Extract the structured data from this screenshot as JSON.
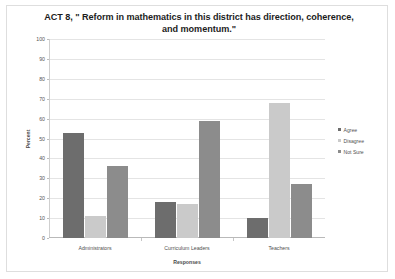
{
  "chart_data": {
    "type": "bar",
    "title": "ACT 8, \" Reform in mathematics in this district has direction, coherence, and momentum.\"",
    "title_line1": "ACT 8, \" Reform in mathematics in this district has direction, coherence,",
    "title_line2": "and momentum.\"",
    "xlabel": "Responses",
    "ylabel": "Percent",
    "ylim": [
      0,
      100
    ],
    "ytick_step": 10,
    "yticks": [
      100,
      90,
      80,
      70,
      60,
      50,
      40,
      30,
      20,
      10,
      0
    ],
    "grid": true,
    "legend_position": "right",
    "categories": [
      "Administrators",
      "Curriculum Leaders",
      "Teachers"
    ],
    "series": [
      {
        "name": "Agree",
        "color": "#6d6d6d",
        "values": [
          53,
          18,
          10
        ]
      },
      {
        "name": "Disagree",
        "color": "#cacaca",
        "values": [
          11,
          17,
          68
        ]
      },
      {
        "name": "Not Sure",
        "color": "#8c8c8c",
        "values": [
          36,
          59,
          27
        ]
      }
    ]
  },
  "legend": {
    "items": [
      {
        "label": "Agree"
      },
      {
        "label": "Disagree"
      },
      {
        "label": "Not Sure"
      }
    ]
  }
}
